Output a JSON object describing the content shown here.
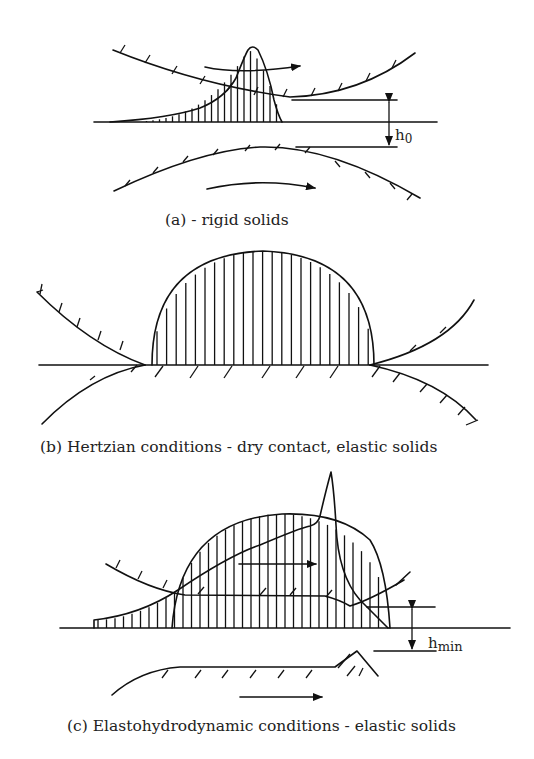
{
  "panels": [
    {
      "id": "a",
      "caption": "(a) - rigid solids",
      "gap_label": "h",
      "gap_subscript": "0",
      "pressure_profile": "hydrodynamic",
      "surfaces": "rigid",
      "motion": [
        "upper surface moves right",
        "lower surface moves right"
      ]
    },
    {
      "id": "b",
      "caption": "(b) Hertzian conditions - dry contact, elastic solids",
      "pressure_profile": "hertzian-semi-ellipse",
      "surfaces": "elastic, flattened in contact"
    },
    {
      "id": "c",
      "caption": "(c) Elastohydrodynamic conditions - elastic solids",
      "gap_label": "h",
      "gap_subscript": "min",
      "pressure_profile": "EHD with pressure spike",
      "surfaces": "elastic, parallel gap with exit constriction",
      "motion": [
        "film flow right",
        "lower surface moves right"
      ]
    }
  ]
}
